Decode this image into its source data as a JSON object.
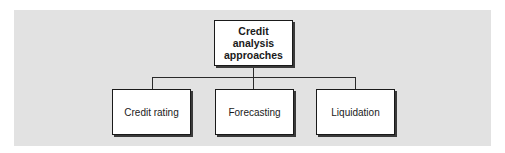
{
  "diagram": {
    "type": "hierarchy",
    "background_color": "#e2e2e2",
    "root": {
      "label_lines": [
        "Credit",
        "analysis",
        "approaches"
      ]
    },
    "children": [
      {
        "label": "Credit rating"
      },
      {
        "label": "Forecasting"
      },
      {
        "label": "Liquidation"
      }
    ]
  }
}
